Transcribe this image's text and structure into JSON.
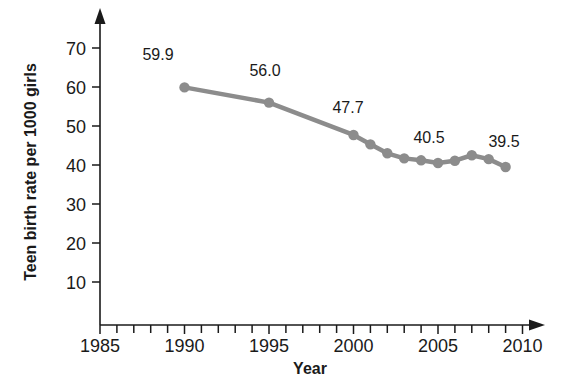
{
  "chart_data": {
    "type": "line",
    "title": "",
    "xlabel": "Year",
    "ylabel": "Teen birth rate per 1000 girls",
    "xlim": [
      1985,
      2011
    ],
    "ylim": [
      0,
      74
    ],
    "xticks": [
      1985,
      1990,
      1995,
      2000,
      2005,
      2010
    ],
    "xtick_labels": [
      "1985",
      "1990",
      "1995",
      "2000",
      "2005",
      "2010"
    ],
    "xtick_minor_step": 1,
    "yticks": [
      10,
      20,
      30,
      40,
      50,
      60,
      70
    ],
    "ytick_labels": [
      "10",
      "20",
      "30",
      "40",
      "50",
      "60",
      "70"
    ],
    "grid": false,
    "legend": null,
    "series_color": "#8c8c8c",
    "marker_color": "#8c8c8c",
    "axis_color": "#1a1a1a",
    "x": [
      1990,
      1995,
      2000,
      2001,
      2002,
      2003,
      2004,
      2005,
      2006,
      2007,
      2008,
      2009
    ],
    "values": [
      59.9,
      56.0,
      47.7,
      45.3,
      43.0,
      41.7,
      41.2,
      40.5,
      41.1,
      42.5,
      41.5,
      39.5
    ],
    "point_labels": [
      {
        "x": 1990,
        "y": 59.9,
        "text": "59.9"
      },
      {
        "x": 1995,
        "y": 56.0,
        "text": "56.0"
      },
      {
        "x": 2000,
        "y": 47.7,
        "text": "47.7"
      },
      {
        "x": 2005,
        "y": 40.5,
        "text": "40.5"
      },
      {
        "x": 2009,
        "y": 39.5,
        "text": "39.5"
      }
    ]
  },
  "axis": {
    "x_title": "Year",
    "y_title": "Teen birth rate per 1000 girls"
  },
  "ytick_text": {
    "t10": "10",
    "t20": "20",
    "t30": "30",
    "t40": "40",
    "t50": "50",
    "t60": "60",
    "t70": "70"
  },
  "xtick_text": {
    "t1985": "1985",
    "t1990": "1990",
    "t1995": "1995",
    "t2000": "2000",
    "t2005": "2005",
    "t2010": "2010"
  },
  "labels": {
    "p1": "59.9",
    "p2": "56.0",
    "p3": "47.7",
    "p4": "40.5",
    "p5": "39.5"
  }
}
